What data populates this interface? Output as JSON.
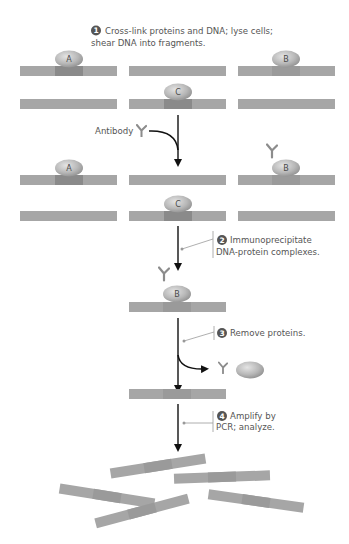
{
  "steps": [
    {
      "number": "1",
      "line1": "Cross-link proteins and DNA; lyse cells;",
      "line2": "shear DNA into fragments."
    },
    {
      "number": "2",
      "line1": "Immunoprecipitate",
      "line2": "DNA-protein complexes."
    },
    {
      "number": "3",
      "line1": "Remove proteins.",
      "line2": ""
    },
    {
      "number": "4",
      "line1": "Amplify by",
      "line2": "PCR; analyze."
    }
  ],
  "labels": {
    "antibody": "Antibody"
  },
  "proteins": {
    "a": "A",
    "b": "B",
    "c": "C"
  },
  "colors": {
    "dna": "#a6a6a6",
    "dna_bound": "#8a8a8a",
    "protein": "#bdbdbd",
    "arrow": "#111111",
    "leader": "#9a9a9a",
    "text": "#555555",
    "badge": "#555555"
  }
}
